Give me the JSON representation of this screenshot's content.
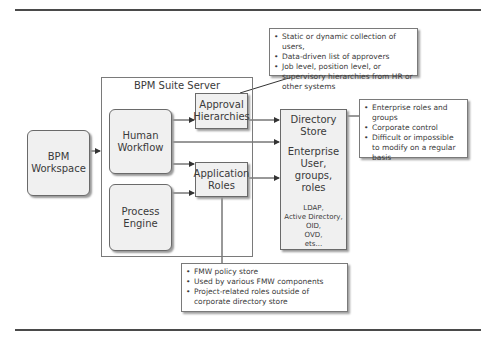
{
  "diagram": {
    "workspace": {
      "label_line1": "BPM",
      "label_line2": "Workspace"
    },
    "server": {
      "title": "BPM Suite Server",
      "human_workflow": {
        "label_line1": "Human",
        "label_line2": "Workflow"
      },
      "process_engine": {
        "label_line1": "Process",
        "label_line2": "Engine"
      },
      "approval_hierarchies": {
        "label_line1": "Approval",
        "label_line2": "Hierarchies"
      },
      "application_roles": {
        "label_line1": "Application",
        "label_line2": "Roles"
      }
    },
    "directory_store": {
      "title_line1": "Directory",
      "title_line2": "Store",
      "main_line1": "Enterprise",
      "main_line2": "User, groups,",
      "main_line3": "roles",
      "examples": [
        "LDAP,",
        "Active Directory,",
        "OID,",
        "OVD,",
        "ets..."
      ]
    },
    "callouts": {
      "approval": [
        "Static or dynamic collection of users,",
        "Data-driven list of approvers",
        "Job level, position level, or supervisory hierarchies from HR or other systems"
      ],
      "directory": [
        "Enterprise roles and groups",
        "Corporate control",
        "Difficult or impossible to modify on a regular basis"
      ],
      "application_roles": [
        "FMW policy store",
        "Used by various FMW components",
        "Project-related roles outside of corporate directory store"
      ]
    }
  }
}
